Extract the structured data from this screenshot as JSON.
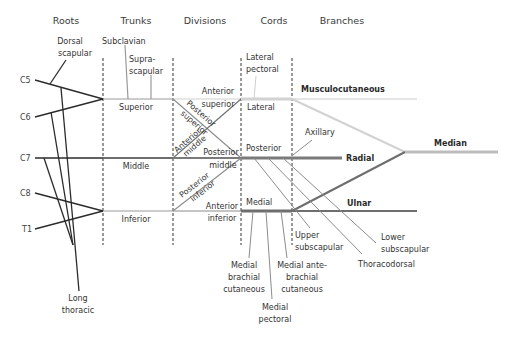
{
  "headers": {
    "roots": "Roots",
    "trunks": "Trunks",
    "divisions": "Divisions",
    "cords": "Cords",
    "branches": "Branches"
  },
  "roots": [
    "C5",
    "C6",
    "C7",
    "C8",
    "T1"
  ],
  "root_branches": {
    "dorsal_scapular": [
      "Dorsal",
      "scapular"
    ],
    "long_thoracic": [
      "Long",
      "thoracic"
    ]
  },
  "trunks": {
    "superior": "Superior",
    "middle": "Middle",
    "inferior": "Inferior",
    "subclavian": "Subclavian",
    "suprascapular": [
      "Supra-",
      "scapular"
    ]
  },
  "divisions": {
    "anterior_superior": [
      "Anterior",
      "superior"
    ],
    "posterior_superior": [
      "Posterior",
      "superior"
    ],
    "anterior_middle": [
      "Anterior",
      "middle"
    ],
    "posterior_middle": [
      "Posterior",
      "middle"
    ],
    "posterior_inferior": [
      "Posterior",
      "inferior"
    ],
    "anterior_inferior": [
      "Anterior",
      "inferior"
    ]
  },
  "cords": {
    "lateral": "Lateral",
    "posterior": "Posterior",
    "medial": "Medial",
    "lateral_pectoral": [
      "Lateral",
      "pectoral"
    ]
  },
  "branches": {
    "musculocutaneous": "Musculocutaneous",
    "axillary": "Axillary",
    "radial": "Radial",
    "median": "Median",
    "ulnar": "Ulnar",
    "upper_subscapular": [
      "Upper",
      "subscapular"
    ],
    "lower_subscapular": [
      "Lower",
      "subscapular"
    ],
    "thoracodorsal": "Thoracodorsal",
    "medial_brachial_cutaneous": [
      "Medial",
      "brachial",
      "cutaneous"
    ],
    "medial_antebrachial_cutaneous": [
      "Medial ante-",
      "brachial",
      "cutaneous"
    ],
    "medial_pectoral": [
      "Medial",
      "pectoral"
    ]
  },
  "colors": {
    "root_line": "#2b2b2b",
    "thin_line": "#8c8c8c",
    "lateral_cord": "#d2d2d2",
    "posterior_cord": "#7a7a7a",
    "medial_cord": "#6e6e6e",
    "median": "#bdbdbd",
    "divider": "#333333"
  }
}
